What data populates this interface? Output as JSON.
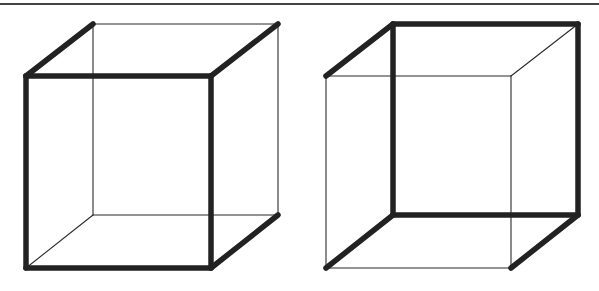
{
  "figure": {
    "title": "",
    "colors": {
      "edge": "#222222",
      "thin_edge": "#2a2a2a",
      "rule": "#444444",
      "background": "#ffffff"
    },
    "top_rule": {
      "x1": 0,
      "y1": 4,
      "x2": 599,
      "y2": 4
    },
    "cubes": [
      {
        "name": "cube-left",
        "interpretation": "front face (lower-left square) seen as nearest",
        "front": [
          [
            26,
            76
          ],
          [
            211,
            76
          ],
          [
            211,
            268
          ],
          [
            26,
            268
          ]
        ],
        "back": [
          [
            93,
            24
          ],
          [
            278,
            24
          ],
          [
            278,
            215
          ],
          [
            93,
            215
          ]
        ],
        "thick_edges": [
          [
            [
              26,
              76
            ],
            [
              211,
              76
            ]
          ],
          [
            [
              211,
              76
            ],
            [
              211,
              268
            ]
          ],
          [
            [
              211,
              268
            ],
            [
              26,
              268
            ]
          ],
          [
            [
              26,
              268
            ],
            [
              26,
              76
            ]
          ],
          [
            [
              26,
              76
            ],
            [
              93,
              24
            ]
          ],
          [
            [
              211,
              76
            ],
            [
              278,
              24
            ]
          ],
          [
            [
              211,
              268
            ],
            [
              278,
              215
            ]
          ]
        ],
        "thin_edges": [
          [
            [
              93,
              24
            ],
            [
              278,
              24
            ]
          ],
          [
            [
              278,
              24
            ],
            [
              278,
              215
            ]
          ],
          [
            [
              278,
              215
            ],
            [
              93,
              215
            ]
          ],
          [
            [
              93,
              215
            ],
            [
              93,
              24
            ]
          ],
          [
            [
              26,
              268
            ],
            [
              93,
              215
            ]
          ]
        ]
      },
      {
        "name": "cube-right",
        "interpretation": "back face (upper-right square) seen as nearest",
        "front": [
          [
            326,
            76
          ],
          [
            511,
            76
          ],
          [
            511,
            268
          ],
          [
            326,
            268
          ]
        ],
        "back": [
          [
            393,
            24
          ],
          [
            578,
            24
          ],
          [
            578,
            215
          ],
          [
            393,
            215
          ]
        ],
        "thick_edges": [
          [
            [
              393,
              24
            ],
            [
              578,
              24
            ]
          ],
          [
            [
              578,
              24
            ],
            [
              578,
              215
            ]
          ],
          [
            [
              578,
              215
            ],
            [
              393,
              215
            ]
          ],
          [
            [
              393,
              215
            ],
            [
              393,
              24
            ]
          ],
          [
            [
              326,
              76
            ],
            [
              393,
              24
            ]
          ],
          [
            [
              326,
              268
            ],
            [
              393,
              215
            ]
          ],
          [
            [
              511,
              268
            ],
            [
              578,
              215
            ]
          ]
        ],
        "thin_edges": [
          [
            [
              326,
              76
            ],
            [
              511,
              76
            ]
          ],
          [
            [
              511,
              76
            ],
            [
              511,
              268
            ]
          ],
          [
            [
              511,
              268
            ],
            [
              326,
              268
            ]
          ],
          [
            [
              326,
              268
            ],
            [
              326,
              76
            ]
          ],
          [
            [
              511,
              76
            ],
            [
              578,
              24
            ]
          ]
        ]
      }
    ]
  }
}
